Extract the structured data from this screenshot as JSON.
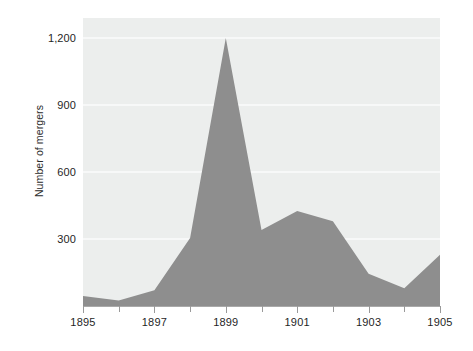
{
  "chart_data": {
    "type": "area",
    "title": "",
    "subtitle": "",
    "xlabel": "",
    "ylabel": "Number of mergers",
    "x": [
      1895,
      1896,
      1897,
      1898,
      1899,
      1900,
      1901,
      1902,
      1903,
      1904,
      1905
    ],
    "values": [
      45,
      25,
      70,
      305,
      1200,
      340,
      425,
      380,
      145,
      80,
      230
    ],
    "series": [
      {
        "name": "Number of mergers",
        "values": [
          45,
          25,
          70,
          305,
          1200,
          340,
          425,
          380,
          145,
          80,
          230
        ]
      }
    ],
    "xlim": [
      1895,
      1905
    ],
    "ylim": [
      0,
      1290
    ],
    "grid": true,
    "grid_axis": "y",
    "legend": false,
    "legend_position": "none",
    "x_tick_labels": [
      "1895",
      "1897",
      "1899",
      "1901",
      "1903",
      "1905"
    ],
    "x_tick_values": [
      1895,
      1897,
      1899,
      1901,
      1903,
      1905
    ],
    "x_minor_tick_values": [
      1896,
      1898,
      1900,
      1902,
      1904
    ],
    "y_tick_labels": [
      "300",
      "600",
      "900",
      "1,200"
    ],
    "y_tick_values": [
      300,
      600,
      900,
      1200
    ],
    "colors": {
      "area_fill": "#8e8e8e",
      "plot_background": "#eceeed",
      "gridline": "#f7f8f8",
      "axis_line": "#a9a9a9",
      "tick_mark": "#9a9a9a",
      "text": "#1f1f1f",
      "page_background": "#ffffff"
    }
  }
}
